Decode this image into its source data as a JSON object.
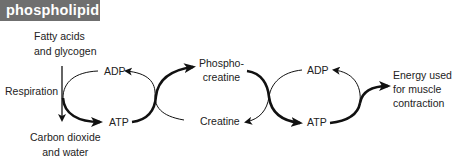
{
  "header": {
    "title": "phospholipid",
    "background": "#6f6f6f",
    "text_color": "#ffffff"
  },
  "diagram": {
    "inputs": {
      "line1": "Fatty acids",
      "line2": "and glycogen"
    },
    "process": "Respiration",
    "outputs": {
      "line1": "Carbon dioxide",
      "line2": "and water"
    },
    "left_cycle": {
      "top": "ADP",
      "bottom": "ATP"
    },
    "middle_cycle": {
      "top_line1": "Phospho-",
      "top_line2": "creatine",
      "bottom": "Creatine"
    },
    "right_cycle": {
      "top": "ADP",
      "bottom": "ATP"
    },
    "result": {
      "line1": "Energy used",
      "line2": "for muscle",
      "line3": "contraction"
    }
  }
}
